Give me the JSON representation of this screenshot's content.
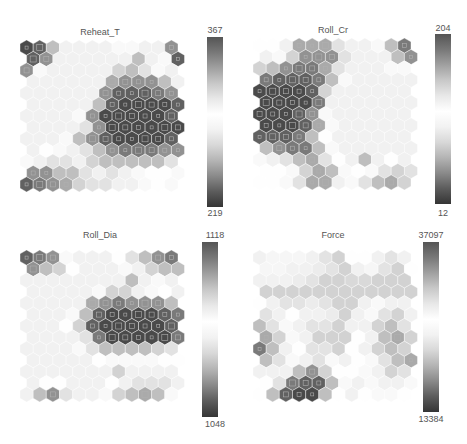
{
  "chart_data": [
    {
      "type": "heatmap",
      "title": "Reheat_T",
      "colorbar": {
        "max": "367",
        "min": "219"
      },
      "grid": {
        "cols": 12,
        "rows": 13
      },
      "values": [
        [
          0.05,
          0.1,
          0.3,
          0.6,
          0.6,
          0.6,
          0.6,
          0.5,
          0.5,
          0.6,
          0.6,
          0.2
        ],
        [
          0.1,
          0.2,
          0.6,
          0.6,
          0.6,
          0.6,
          0.6,
          0.6,
          0.3,
          0.6,
          0.5,
          0.1
        ],
        [
          0.2,
          0.5,
          0.6,
          0.6,
          0.6,
          0.6,
          0.6,
          0.35,
          0.3,
          0.4,
          0.5,
          0.6
        ],
        [
          0.6,
          0.6,
          0.6,
          0.6,
          0.6,
          0.6,
          0.25,
          0.2,
          0.2,
          0.2,
          0.3,
          0.6
        ],
        [
          0.6,
          0.6,
          0.6,
          0.6,
          0.6,
          0.6,
          0.2,
          0.1,
          0.1,
          0.1,
          0.15,
          0.2
        ],
        [
          0.6,
          0.6,
          0.6,
          0.6,
          0.6,
          0.3,
          0.1,
          0.05,
          0.05,
          0.05,
          0.05,
          0.1
        ],
        [
          0.6,
          0.6,
          0.6,
          0.6,
          0.5,
          0.2,
          0.05,
          0.05,
          0.05,
          0.05,
          0.05,
          0.1
        ],
        [
          0.6,
          0.6,
          0.6,
          0.6,
          0.4,
          0.2,
          0.05,
          0.05,
          0.05,
          0.05,
          0.05,
          0.05
        ],
        [
          0.6,
          0.6,
          0.6,
          0.5,
          0.3,
          0.2,
          0.1,
          0.05,
          0.05,
          0.05,
          0.05,
          0.1
        ],
        [
          0.6,
          0.55,
          0.5,
          0.45,
          0.4,
          0.3,
          0.2,
          0.15,
          0.15,
          0.15,
          0.2,
          0.2
        ],
        [
          0.5,
          0.45,
          0.4,
          0.4,
          0.45,
          0.35,
          0.3,
          0.3,
          0.3,
          0.3,
          0.3,
          0.4
        ],
        [
          0.2,
          0.2,
          0.3,
          0.3,
          0.4,
          0.45,
          0.4,
          0.45,
          0.5,
          0.55,
          0.55,
          0.5
        ],
        [
          0.1,
          0.15,
          0.2,
          0.25,
          0.35,
          0.4,
          0.4,
          0.45,
          0.45,
          0.5,
          0.55,
          0.5
        ]
      ]
    },
    {
      "type": "heatmap",
      "title": "Roll_Cr",
      "colorbar": {
        "max": "204",
        "min": "12"
      },
      "grid": {
        "cols": 12,
        "rows": 13
      },
      "values": [
        [
          0.55,
          0.55,
          0.45,
          0.25,
          0.25,
          0.25,
          0.4,
          0.6,
          0.6,
          0.5,
          0.3,
          0.15
        ],
        [
          0.6,
          0.5,
          0.35,
          0.2,
          0.2,
          0.2,
          0.4,
          0.6,
          0.6,
          0.45,
          0.3,
          0.2
        ],
        [
          0.35,
          0.3,
          0.2,
          0.15,
          0.15,
          0.25,
          0.4,
          0.6,
          0.6,
          0.6,
          0.5,
          0.5
        ],
        [
          0.15,
          0.1,
          0.1,
          0.1,
          0.15,
          0.3,
          0.5,
          0.6,
          0.6,
          0.6,
          0.6,
          0.6
        ],
        [
          0.05,
          0.05,
          0.05,
          0.05,
          0.1,
          0.35,
          0.6,
          0.6,
          0.6,
          0.6,
          0.6,
          0.6
        ],
        [
          0.05,
          0.05,
          0.05,
          0.05,
          0.15,
          0.45,
          0.6,
          0.6,
          0.6,
          0.6,
          0.6,
          0.6
        ],
        [
          0.05,
          0.05,
          0.05,
          0.1,
          0.2,
          0.5,
          0.6,
          0.6,
          0.6,
          0.6,
          0.6,
          0.6
        ],
        [
          0.05,
          0.05,
          0.05,
          0.1,
          0.25,
          0.5,
          0.6,
          0.6,
          0.6,
          0.6,
          0.6,
          0.6
        ],
        [
          0.1,
          0.1,
          0.1,
          0.15,
          0.3,
          0.55,
          0.6,
          0.6,
          0.6,
          0.6,
          0.6,
          0.6
        ],
        [
          0.3,
          0.2,
          0.15,
          0.15,
          0.3,
          0.5,
          0.6,
          0.6,
          0.6,
          0.6,
          0.6,
          0.6
        ],
        [
          0.5,
          0.45,
          0.4,
          0.3,
          0.25,
          0.4,
          0.55,
          0.6,
          0.75,
          0.6,
          0.55,
          0.6
        ],
        [
          0.55,
          0.55,
          0.5,
          0.35,
          0.25,
          0.3,
          0.5,
          0.55,
          0.5,
          0.4,
          0.35,
          0.4
        ],
        [
          0.55,
          0.55,
          0.5,
          0.4,
          0.25,
          0.25,
          0.45,
          0.5,
          0.4,
          0.3,
          0.25,
          0.35
        ]
      ]
    },
    {
      "type": "heatmap",
      "title": "Roll_Dia",
      "colorbar": {
        "max": "1118",
        "min": "1048"
      },
      "grid": {
        "cols": 12,
        "rows": 13
      },
      "values": [
        [
          0.1,
          0.15,
          0.2,
          0.5,
          0.6,
          0.6,
          0.6,
          0.55,
          0.4,
          0.3,
          0.2,
          0.15
        ],
        [
          0.2,
          0.3,
          0.35,
          0.55,
          0.6,
          0.6,
          0.6,
          0.5,
          0.45,
          0.35,
          0.3,
          0.3
        ],
        [
          0.6,
          0.6,
          0.6,
          0.6,
          0.6,
          0.6,
          0.6,
          0.6,
          0.75,
          0.6,
          0.5,
          0.6
        ],
        [
          0.6,
          0.6,
          0.6,
          0.6,
          0.6,
          0.5,
          0.35,
          0.35,
          0.45,
          0.5,
          0.55,
          0.6
        ],
        [
          0.6,
          0.6,
          0.6,
          0.6,
          0.45,
          0.25,
          0.2,
          0.15,
          0.2,
          0.2,
          0.2,
          0.3
        ],
        [
          0.6,
          0.6,
          0.6,
          0.5,
          0.3,
          0.1,
          0.05,
          0.05,
          0.05,
          0.05,
          0.1,
          0.15
        ],
        [
          0.6,
          0.6,
          0.6,
          0.55,
          0.35,
          0.1,
          0.05,
          0.05,
          0.05,
          0.05,
          0.05,
          0.1
        ],
        [
          0.6,
          0.6,
          0.6,
          0.6,
          0.4,
          0.15,
          0.05,
          0.05,
          0.05,
          0.05,
          0.05,
          0.15
        ],
        [
          0.6,
          0.6,
          0.6,
          0.6,
          0.5,
          0.4,
          0.3,
          0.3,
          0.3,
          0.3,
          0.35,
          0.4
        ],
        [
          0.6,
          0.6,
          0.6,
          0.6,
          0.6,
          0.55,
          0.5,
          0.5,
          0.5,
          0.5,
          0.55,
          0.55
        ],
        [
          0.6,
          0.6,
          0.6,
          0.6,
          0.6,
          0.6,
          0.6,
          0.7,
          0.6,
          0.6,
          0.6,
          0.6
        ],
        [
          0.6,
          0.55,
          0.55,
          0.6,
          0.6,
          0.6,
          0.55,
          0.45,
          0.4,
          0.4,
          0.4,
          0.45
        ],
        [
          0.6,
          0.3,
          0.2,
          0.4,
          0.6,
          0.6,
          0.5,
          0.35,
          0.3,
          0.25,
          0.3,
          0.5
        ]
      ]
    },
    {
      "type": "heatmap",
      "title": "Force",
      "colorbar": {
        "max": "37097",
        "min": "13384"
      },
      "grid": {
        "cols": 12,
        "rows": 13
      },
      "values": [
        [
          0.6,
          0.58,
          0.58,
          0.58,
          0.6,
          0.65,
          0.7,
          0.55,
          0.55,
          0.6,
          0.65,
          0.6
        ],
        [
          0.58,
          0.58,
          0.6,
          0.6,
          0.62,
          0.65,
          0.7,
          0.6,
          0.58,
          0.65,
          0.7,
          0.55
        ],
        [
          0.6,
          0.6,
          0.6,
          0.62,
          0.65,
          0.7,
          0.7,
          0.68,
          0.68,
          0.7,
          0.7,
          0.7
        ],
        [
          0.7,
          0.7,
          0.7,
          0.7,
          0.7,
          0.7,
          0.7,
          0.7,
          0.7,
          0.7,
          0.7,
          0.7
        ],
        [
          0.55,
          0.6,
          0.65,
          0.65,
          0.62,
          0.65,
          0.7,
          0.7,
          0.6,
          0.5,
          0.45,
          0.6
        ],
        [
          0.4,
          0.45,
          0.55,
          0.6,
          0.6,
          0.62,
          0.7,
          0.6,
          0.5,
          0.4,
          0.35,
          0.45
        ],
        [
          0.3,
          0.4,
          0.5,
          0.6,
          0.65,
          0.65,
          0.7,
          0.6,
          0.45,
          0.35,
          0.3,
          0.4
        ],
        [
          0.25,
          0.35,
          0.5,
          0.6,
          0.7,
          0.7,
          0.7,
          0.55,
          0.45,
          0.3,
          0.25,
          0.35
        ],
        [
          0.15,
          0.3,
          0.45,
          0.55,
          0.65,
          0.65,
          0.7,
          0.55,
          0.45,
          0.35,
          0.3,
          0.35
        ],
        [
          0.3,
          0.4,
          0.5,
          0.45,
          0.4,
          0.5,
          0.6,
          0.55,
          0.5,
          0.4,
          0.3,
          0.25
        ],
        [
          0.45,
          0.6,
          0.45,
          0.3,
          0.2,
          0.35,
          0.55,
          0.55,
          0.5,
          0.45,
          0.35,
          0.4
        ],
        [
          0.55,
          0.4,
          0.15,
          0.1,
          0.1,
          0.3,
          0.5,
          0.6,
          0.5,
          0.45,
          0.45,
          0.5
        ],
        [
          0.55,
          0.3,
          0.1,
          0.05,
          0.05,
          0.3,
          0.55,
          0.6,
          0.55,
          0.5,
          0.5,
          0.55
        ]
      ]
    }
  ],
  "colormap": {
    "stops": [
      "#353535",
      "#5c5c5c",
      "#8a8a8a",
      "#b4b4b4",
      "#d8d8d8",
      "#f2f2f2",
      "#ffffff",
      "#e8e8e8",
      "#c8c8c8",
      "#a0a0a0",
      "#787878",
      "#555555"
    ]
  }
}
